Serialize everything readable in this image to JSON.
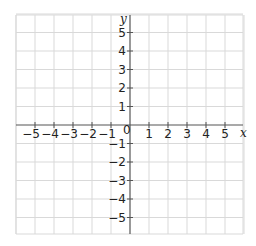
{
  "diagram": {
    "type": "coordinate-plane",
    "x_axis": {
      "label": "x",
      "min": -5,
      "max": 5,
      "ticks": [
        "-5",
        "-4",
        "-3",
        "-2",
        "-1",
        "1",
        "2",
        "3",
        "4",
        "5"
      ]
    },
    "y_axis": {
      "label": "y",
      "min": -5,
      "max": 5,
      "ticks": [
        "5",
        "4",
        "3",
        "2",
        "1",
        "-1",
        "-2",
        "-3",
        "-4",
        "-5"
      ]
    },
    "origin_label": "0",
    "grid": {
      "columns": 12,
      "rows": 12,
      "color": "#d9d9d9",
      "axis_color": "#555555"
    }
  }
}
